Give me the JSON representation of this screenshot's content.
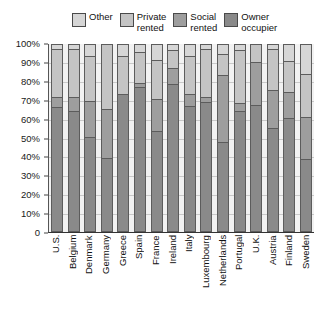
{
  "chart_data": {
    "type": "bar",
    "subtype": "stacked-100-percent",
    "title": "",
    "xlabel": "",
    "ylabel": "",
    "ylim": [
      0,
      100
    ],
    "yticks": [
      "0",
      "10%",
      "20%",
      "30%",
      "40%",
      "50%",
      "60%",
      "70%",
      "80%",
      "90%",
      "100%"
    ],
    "ytick_values": [
      0,
      10,
      20,
      30,
      40,
      50,
      60,
      70,
      80,
      90,
      100
    ],
    "grid": true,
    "legend_position": "top",
    "categories": [
      "U.S.",
      "Belgium",
      "Denmark",
      "Germany",
      "Greece",
      "Spain",
      "France",
      "Ireland",
      "Italy",
      "Luxembourg",
      "Netherlands",
      "Portugal",
      "U.K.",
      "Austria",
      "Finland",
      "Sweden"
    ],
    "series": [
      {
        "name": "Owner occupier",
        "color": "#8a8a8a",
        "values": [
          67,
          65,
          51,
          39,
          74,
          78,
          54,
          80,
          68,
          70,
          48,
          65,
          68,
          56,
          61,
          39
        ]
      },
      {
        "name": "Social rented",
        "color": "#9e9e9e",
        "values": [
          5,
          7,
          19,
          26,
          0,
          2,
          17,
          8,
          6,
          2,
          36,
          4,
          23,
          20,
          14,
          22
        ]
      },
      {
        "name": "Private rented",
        "color": "#c4c4c4",
        "values": [
          26,
          26,
          24,
          35,
          20,
          16,
          21,
          9,
          20,
          26,
          11,
          28,
          9,
          22,
          16,
          23
        ]
      },
      {
        "name": "Other",
        "color": "#d6d6d6",
        "values": [
          2,
          2,
          6,
          0,
          6,
          4,
          8,
          3,
          6,
          2,
          5,
          3,
          0,
          2,
          9,
          16
        ]
      }
    ],
    "legend": [
      {
        "label": "Other",
        "color": "#d6d6d6"
      },
      {
        "label": "Private\nrented",
        "color": "#c4c4c4"
      },
      {
        "label": "Social\nrented",
        "color": "#9e9e9e"
      },
      {
        "label": "Owner\noccupier",
        "color": "#8a8a8a"
      }
    ],
    "plot_background": "#f2f2f2",
    "gridline_color": "#c9c9c9",
    "bar_border_color": "#5c5c5c"
  }
}
